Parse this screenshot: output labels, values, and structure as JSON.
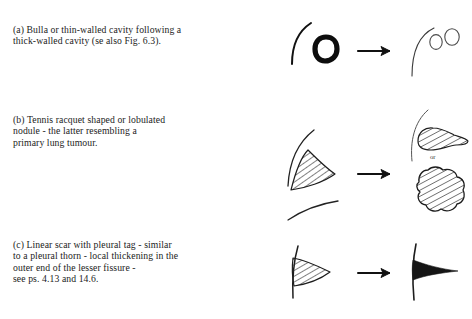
{
  "document": {
    "type": "radiology-illustration-figure",
    "background_color": "#ffffff",
    "ink_color": "#1a1a1a"
  },
  "rows": [
    {
      "id": "a",
      "caption": "(a) Bulla or thin-walled cavity following a\nthick-walled cavity (se also Fig. 6.3).",
      "before_label": "thick-walled cavity on pleural curve",
      "arrow": "right-arrow",
      "after_label": "thin-walled bullae on pleural curve"
    },
    {
      "id": "b",
      "caption": "(b) Tennis racquet shaped or lobulated\nnodule - the latter resembling a\nprimary lung tumour.",
      "before_label": "hatched wedge against fissure",
      "arrow": "right-arrow",
      "after_label": "tennis racquet shaped nodule",
      "alternative_connector": "or",
      "after_alt_label": "lobulated nodule"
    },
    {
      "id": "c",
      "caption": "(c) Linear scar with pleural tag - similar\nto a pleural thorn - local thickening in the\nouter end of the lesser fissure -\nsee ps. 4.13 and 14.6.",
      "before_label": "hatched wedge on pleural line",
      "arrow": "right-arrow",
      "after_label": "pleural thorn spike on pleural line"
    }
  ]
}
